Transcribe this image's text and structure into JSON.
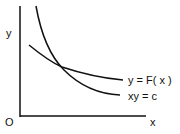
{
  "diagram": {
    "axes": {
      "y_label": "y",
      "x_label": "x",
      "origin_label": "O"
    },
    "curves": [
      {
        "name": "y-equals-F-of-x",
        "label": "y = F( x )"
      },
      {
        "name": "xy-equals-c",
        "label": "xy = c"
      }
    ],
    "colors": {
      "stroke": "#111111",
      "background": "#ffffff"
    }
  }
}
